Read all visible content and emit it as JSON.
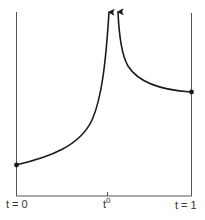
{
  "diagram": {
    "type": "path-blowup-plot",
    "labels": {
      "t_start": "t = 0",
      "t_mid_base": "t",
      "t_mid_sup": "0",
      "t_end": "t = 1"
    },
    "colors": {
      "curve": "#1a1a1a",
      "axis": "#555555",
      "dot": "#1a1a1a"
    },
    "elements": {
      "left_boundary": "vertical line at t = 0",
      "right_boundary": "vertical line at t = 1",
      "baseline": "horizontal axis",
      "tick": "tick at t0",
      "left_curve": "curve rising from dot at t=0 to infinity near t0 (arrow up)",
      "right_curve": "curve descending from infinity near t0 to dot at t=1 (arrow up)",
      "start_point": "dot on left boundary",
      "end_point": "dot on right boundary"
    }
  }
}
